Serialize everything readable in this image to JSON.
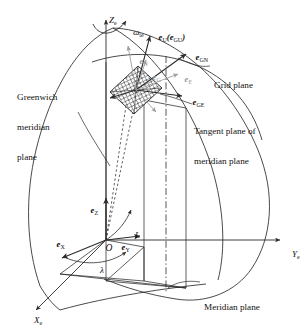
{
  "figure": {
    "background": "#ffffff",
    "stroke_color": "#2b2b2b",
    "faint_stroke_color": "#9e9e9e",
    "hatch_color": "#3a3a3a",
    "width": 306,
    "height": 330
  },
  "axes": [
    {
      "name": "z-axis",
      "label": "Z",
      "sub": "e",
      "x": 100,
      "y": 6
    },
    {
      "name": "y-axis",
      "label": "Y",
      "sub": "e",
      "x": 283,
      "y": 240
    },
    {
      "name": "x-axis",
      "label": "X",
      "sub": "e",
      "x": 25,
      "y": 306
    }
  ],
  "rotation": {
    "name": "earth-rate",
    "label": "ω",
    "sub": "ie",
    "x": 124,
    "y": 18
  },
  "origin": {
    "label": "O",
    "x": 96,
    "y": 233
  },
  "angles": [
    {
      "name": "longitude",
      "label": "λ",
      "x": 91,
      "y": 256
    },
    {
      "name": "latitude",
      "label": "L",
      "x": 126,
      "y": 221
    }
  ],
  "body_vectors": [
    {
      "name": "e-z",
      "label": "e",
      "sub": "Z",
      "x": 82,
      "y": 197
    },
    {
      "name": "e-x",
      "label": "e",
      "sub": "X",
      "x": 48,
      "y": 231
    },
    {
      "name": "e-y",
      "label": "e",
      "sub": "Y",
      "x": 113,
      "y": 234
    }
  ],
  "grid_vectors": [
    {
      "name": "e-u-egu",
      "label": "e",
      "sub": "U",
      "paren": "(e",
      "paren_sub": "GU",
      "paren_close": ")",
      "x": 150,
      "y": 24
    },
    {
      "name": "e-gn",
      "label": "e",
      "sub": "GN",
      "x": 187,
      "y": 44
    },
    {
      "name": "e-ge",
      "label": "e",
      "sub": "GE",
      "x": 184,
      "y": 89
    },
    {
      "name": "e-n-faint",
      "label": "e",
      "sub": "N",
      "x": 131,
      "y": 48,
      "faint": true
    },
    {
      "name": "e-e-faint",
      "label": "e",
      "sub": "E",
      "x": 176,
      "y": 66,
      "faint": true
    },
    {
      "name": "e-g-faint",
      "label": "e",
      "sub": "G",
      "x": 144,
      "y": 64,
      "faint": true
    }
  ],
  "callouts": [
    {
      "name": "greenwich-meridian-plane",
      "lines": [
        "Greenwich",
        "meridian",
        "plane"
      ],
      "x": 17,
      "y": 73
    },
    {
      "name": "grid-plane",
      "lines": [
        "Grid plane"
      ],
      "x": 214,
      "y": 61
    },
    {
      "name": "tangent-plane-of-meridian-plane",
      "lines": [
        "Tangent plane of",
        "meridian plane"
      ],
      "x": 194,
      "y": 107
    },
    {
      "name": "meridian-plane",
      "lines": [
        "Meridian plane"
      ],
      "x": 204,
      "y": 283
    }
  ]
}
